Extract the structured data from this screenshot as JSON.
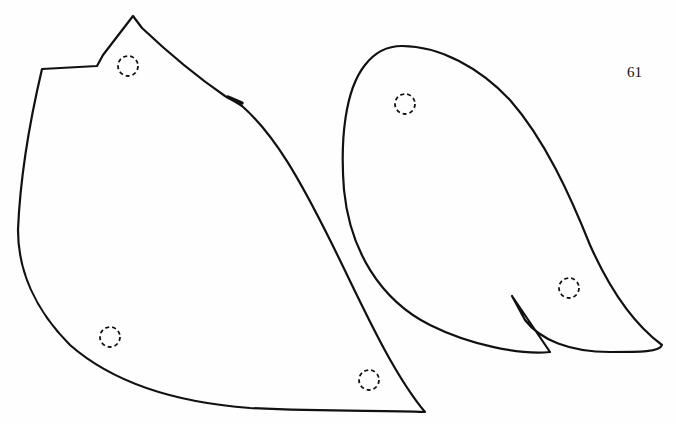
{
  "page": {
    "number": "61",
    "colors": {
      "ink": "#111111",
      "background": "#fefefe"
    },
    "pieces": [
      {
        "name": "left-pattern-piece",
        "markers": 4
      },
      {
        "name": "right-pattern-piece",
        "markers": 2
      }
    ]
  }
}
